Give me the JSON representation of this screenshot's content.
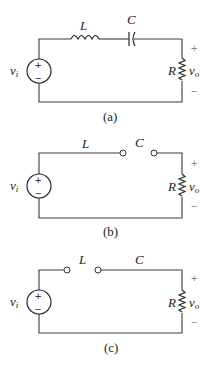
{
  "figure": {
    "panels": [
      {
        "id": "a",
        "caption": "(a)",
        "description": "Series RLC circuit: source, inductor L and capacitor C in series with resistor R",
        "labels": {
          "source": "v",
          "source_sub": "i",
          "inductor": "L",
          "capacitor": "C",
          "resistor": "R",
          "output": "v",
          "output_sub": "o",
          "plus": "+",
          "minus": "−"
        }
      },
      {
        "id": "b",
        "caption": "(b)",
        "description": "Low-frequency equivalent: inductor short, capacitor open",
        "labels": {
          "source": "v",
          "source_sub": "i",
          "inductor": "L",
          "capacitor": "C",
          "resistor": "R",
          "output": "v",
          "output_sub": "o",
          "plus": "+",
          "minus": "−"
        }
      },
      {
        "id": "c",
        "caption": "(c)",
        "description": "High-frequency equivalent: inductor open, capacitor short",
        "labels": {
          "source": "v",
          "source_sub": "i",
          "inductor": "L",
          "capacitor": "C",
          "resistor": "R",
          "output": "v",
          "output_sub": "o",
          "plus": "+",
          "minus": "−"
        }
      }
    ]
  },
  "colors": {
    "wire": "#3a3a3a",
    "polarity": "#888888",
    "background": "#ffffff"
  }
}
